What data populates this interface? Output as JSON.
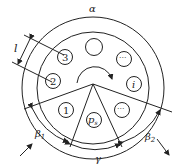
{
  "diagram": {
    "type": "circular-slot-layout",
    "labels": {
      "alpha": "α",
      "beta1": "β",
      "beta1_sub": "1",
      "beta2": "β",
      "beta2_sub": "2",
      "gamma": "γ",
      "l": "l",
      "p": "p",
      "p_sub": "s"
    },
    "slots": [
      {
        "id": "slot-3",
        "label": "3"
      },
      {
        "id": "slot-2",
        "label": "2"
      },
      {
        "id": "slot-1",
        "label": "1"
      },
      {
        "id": "slot-ps",
        "label": "p_s"
      },
      {
        "id": "slot-dots-bottom",
        "label": "···"
      },
      {
        "id": "slot-i",
        "label": "i"
      },
      {
        "id": "slot-dots-top",
        "label": "···"
      },
      {
        "id": "slot-empty",
        "label": ""
      }
    ],
    "colors": {
      "stroke": "#222222",
      "background": "#ffffff"
    }
  }
}
